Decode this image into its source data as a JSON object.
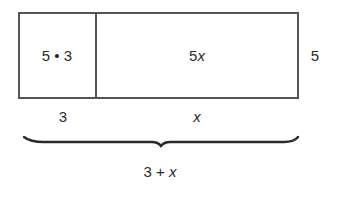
{
  "diagram": {
    "regions": [
      {
        "label": "5 • 3",
        "width_label": "3"
      },
      {
        "label": "5x",
        "width_label": "x"
      }
    ],
    "height_label": "5",
    "total_width_label": "3 + x"
  },
  "colors": {
    "stroke": "#555555",
    "text": "#2a2a2a",
    "background": "#ffffff"
  }
}
